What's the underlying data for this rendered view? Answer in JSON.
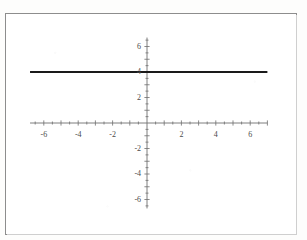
{
  "figure": {
    "kind": "cartesian-plot",
    "frame_border_color": "#8d8d8d",
    "background_color": "#ffffff"
  },
  "chart_data": {
    "type": "line",
    "title": "",
    "subtitle": "",
    "xlabel": "",
    "ylabel": "",
    "xlim": [
      -7,
      7
    ],
    "ylim": [
      -7,
      7
    ],
    "grid": false,
    "legend": null,
    "axis_color": "#6f6f6f",
    "series": [
      {
        "name": "y = 4",
        "equation": "y = 4",
        "color": "#1a1a1a",
        "line_width": 2,
        "x": [
          -6.8,
          7.0
        ],
        "values": [
          4,
          4
        ]
      }
    ],
    "x_axis": {
      "labeled_ticks": [
        -6,
        -4,
        -2,
        2,
        4,
        6
      ],
      "labeled_tick_text": [
        "-6",
        "-4",
        "-2",
        "2",
        "4",
        "6"
      ],
      "major_tick_interval": 1,
      "minor_tick_interval": 0.5,
      "tick_range": [
        -6.8,
        7.0
      ]
    },
    "y_axis": {
      "labeled_ticks": [
        6,
        4,
        2,
        -2,
        -4,
        -6
      ],
      "labeled_tick_text": [
        "6",
        "4",
        "2",
        "-2",
        "-4",
        "-6"
      ],
      "major_tick_interval": 1,
      "minor_tick_interval": 0.5,
      "tick_range": [
        -6.7,
        6.7
      ]
    },
    "annotations": []
  }
}
